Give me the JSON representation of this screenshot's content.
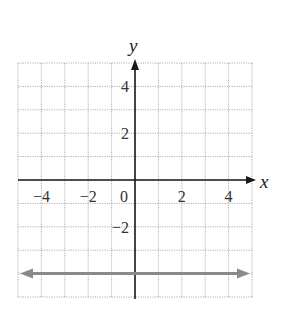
{
  "chart_data": {
    "type": "line",
    "title": "",
    "xlabel": "x",
    "ylabel": "y",
    "xlim": [
      -5,
      5
    ],
    "ylim": [
      -5,
      5
    ],
    "grid": true,
    "grid_step": 1,
    "x_ticks": [
      {
        "value": -4,
        "label": "−4"
      },
      {
        "value": -2,
        "label": "−2"
      },
      {
        "value": 0,
        "label": "0"
      },
      {
        "value": 2,
        "label": "2"
      },
      {
        "value": 4,
        "label": "4"
      }
    ],
    "y_ticks": [
      {
        "value": 4,
        "label": "4"
      },
      {
        "value": 2,
        "label": "2"
      },
      {
        "value": -2,
        "label": "−2"
      }
    ],
    "series": [
      {
        "name": "horizontal line y = -4",
        "equation": "y = -4",
        "x": [
          -5,
          5
        ],
        "y": [
          -4,
          -4
        ],
        "color": "#8a8a8a",
        "arrows": "both"
      }
    ],
    "legend": null
  },
  "colors": {
    "grid": "#9a9a9a",
    "axis": "#1a1a1a",
    "line": "#8a8a8a"
  }
}
